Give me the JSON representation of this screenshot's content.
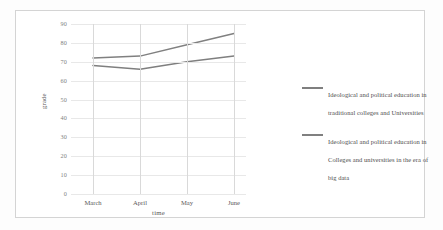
{
  "chart_data": {
    "type": "line",
    "title": "",
    "xlabel": "time",
    "ylabel": "grade",
    "categories": [
      "March",
      "April",
      "May",
      "June"
    ],
    "ylim": [
      0,
      90
    ],
    "yticks": [
      0,
      10,
      20,
      30,
      40,
      50,
      60,
      70,
      80,
      90
    ],
    "grid": true,
    "legend_position": "right",
    "series": [
      {
        "name": "Ideological and political education in traditional colleges and Universities",
        "values": [
          68,
          66,
          70,
          73
        ],
        "color": "#7f7f7f"
      },
      {
        "name": "Ideological and political education in Colleges and universities in the era of big data",
        "values": [
          72,
          73,
          79,
          85
        ],
        "color": "#808080"
      }
    ]
  },
  "axes": {
    "y_title": "grade",
    "x_title": "time",
    "y_tick_labels": [
      "90",
      "80",
      "70",
      "60",
      "50",
      "40",
      "30",
      "20",
      "10",
      "0"
    ],
    "x_tick_labels": [
      "March",
      "April",
      "May",
      "June"
    ]
  },
  "legend": {
    "entries": [
      {
        "label": "Ideological and political education in traditional colleges and Universities",
        "color": "#7f7f7f"
      },
      {
        "label": "Ideological and political education in Colleges and universities in the era of big data",
        "color": "#808080"
      }
    ]
  }
}
